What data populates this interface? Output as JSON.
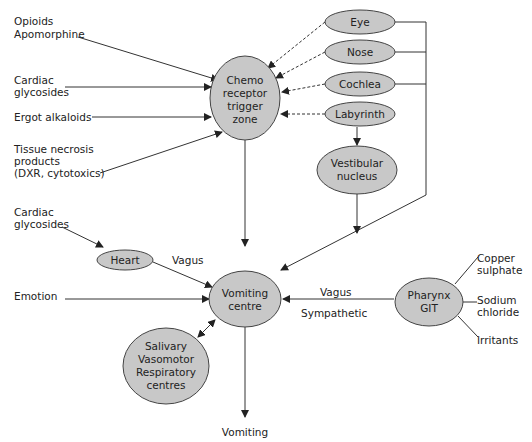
{
  "diagram": {
    "nodes": {
      "ctz": [
        "Chemo",
        "receptor",
        "trigger",
        "zone"
      ],
      "eye": "Eye",
      "nose": "Nose",
      "cochlea": "Cochlea",
      "labyrinth": "Labyrinth",
      "vestibular": [
        "Vestibular",
        "nucleus"
      ],
      "heart": "Heart",
      "vomiting_centre": [
        "Vomiting",
        "centre"
      ],
      "pharynx": [
        "Pharynx",
        "GIT"
      ],
      "salivary": [
        "Salivary",
        "Vasomotor",
        "Respiratory",
        "centres"
      ]
    },
    "inputs": {
      "opioids": [
        "Opioids",
        "Apomorphine"
      ],
      "cardiac1": [
        "Cardiac",
        "glycosides"
      ],
      "ergot": "Ergot alkaloids",
      "tissue": [
        "Tissue necrosis",
        "products",
        "(DXR, cytotoxics)"
      ],
      "cardiac2": [
        "Cardiac",
        "glycosides"
      ],
      "emotion": "Emotion",
      "copper": [
        "Copper",
        "sulphate"
      ],
      "sodium": [
        "Sodium",
        "chloride"
      ],
      "irritants": "Irritants"
    },
    "edge_labels": {
      "vagus_heart": "Vagus",
      "vagus_pharynx": "Vagus",
      "sympathetic": "Sympathetic",
      "output": "Vomiting"
    }
  }
}
